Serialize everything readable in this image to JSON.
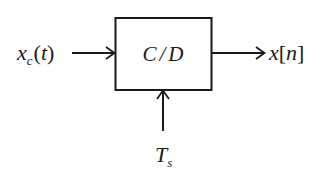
{
  "diagram": {
    "type": "block-diagram",
    "block": {
      "label_main": "C",
      "label_sep": "/",
      "label_end": "D",
      "full_label": "C/D"
    },
    "input": {
      "symbol": "x",
      "subscript": "c",
      "open_paren": "(",
      "argument": "t",
      "close_paren": ")",
      "full_label": "x_c(t)"
    },
    "output": {
      "symbol": "x",
      "open_bracket": "[",
      "argument": "n",
      "close_bracket": "]",
      "full_label": "x[n]"
    },
    "control": {
      "symbol": "T",
      "subscript": "s",
      "full_label": "T_s"
    },
    "colors": {
      "stroke": "#1a1a1a",
      "background": "#ffffff"
    }
  }
}
